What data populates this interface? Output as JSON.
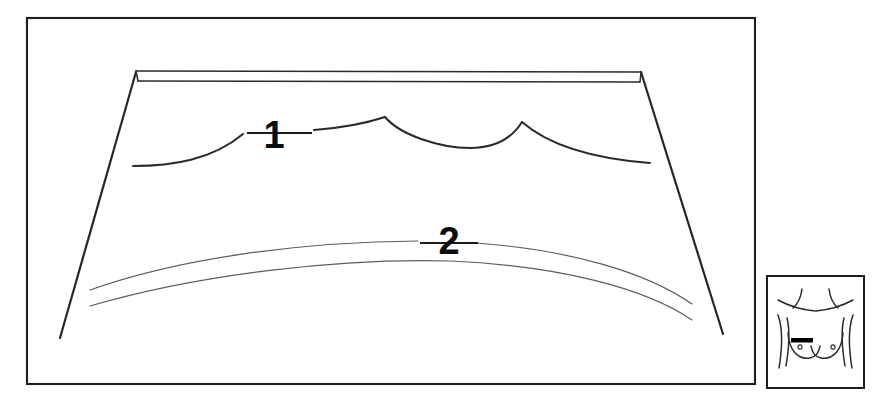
{
  "figure": {
    "background_color": "#ffffff",
    "line_color": "#262626",
    "faint_line_color": "#5c5c5c",
    "marker_color": "#000000",
    "width": 885,
    "height": 405
  },
  "main_panel": {
    "name": "main-illustration-frame",
    "border_color": "#1d1d1d",
    "bounds": {
      "x": 27,
      "y": 18,
      "width": 728,
      "height": 366
    }
  },
  "callouts": [
    {
      "id": "callout-1",
      "label": "1",
      "x": 274,
      "y": 148,
      "leader_from_x": 247,
      "leader_from_y": 133,
      "leader_to_x": 312,
      "leader_to_y": 133,
      "description": "upper scalloped drape edge"
    },
    {
      "id": "callout-2",
      "label": "2",
      "x": 437,
      "y": 254,
      "leader_from_x": 420,
      "leader_from_y": 243,
      "leader_to_x": 478,
      "leader_to_y": 243,
      "description": "lower curved drape fold"
    }
  ],
  "drape": {
    "name": "drape-trapezoid",
    "top_band_label": "waistband-double-line",
    "left_edge": {
      "top_x": 136,
      "top_y": 71,
      "bottom_x": 60,
      "bottom_y": 338
    },
    "right_edge": {
      "top_x": 640,
      "top_y": 71,
      "bottom_x": 723,
      "bottom_y": 334
    },
    "top_band": {
      "left_x": 136,
      "right_x": 641,
      "upper_y": 71,
      "lower_y": 81
    }
  },
  "inset_panel": {
    "name": "torso-inset-thumbnail",
    "border_color": "#1d1d1d",
    "bounds": {
      "x": 767,
      "y": 276,
      "width": 97,
      "height": 112
    },
    "subject": "female-torso-front-view",
    "features": [
      "neck",
      "shoulders",
      "clavicles",
      "left-breast",
      "right-breast",
      "left-nipple",
      "right-nipple",
      "surgical-marker-bar"
    ],
    "marker": {
      "name": "surgical-marker-bar",
      "color": "#000000",
      "side": "left-breast",
      "x": 791,
      "y": 339,
      "width": 22,
      "height": 4
    }
  }
}
